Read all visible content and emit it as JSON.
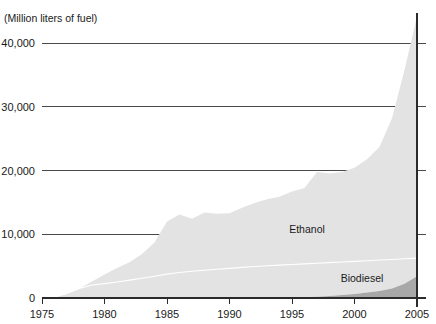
{
  "chart_data": {
    "type": "area",
    "stacked": true,
    "title": "",
    "subtitle": "",
    "ylabel": "(Million liters of fuel)",
    "xlabel": "",
    "grid": "horizontal",
    "legend_position": "inline-annotations",
    "xlim": [
      1975,
      2005
    ],
    "ylim": [
      0,
      44500
    ],
    "yticks": [
      0,
      10000,
      20000,
      30000,
      40000
    ],
    "ytick_labels": [
      "0",
      "10,000",
      "20,000",
      "30,000",
      "40,000"
    ],
    "xticks": [
      1975,
      1980,
      1985,
      1990,
      1995,
      2000,
      2005
    ],
    "xtick_labels": [
      "1975",
      "1980",
      "1985",
      "1990",
      "1995",
      "2000",
      "2005"
    ],
    "x": [
      1975,
      1976,
      1977,
      1978,
      1979,
      1980,
      1981,
      1982,
      1983,
      1984,
      1985,
      1986,
      1987,
      1988,
      1989,
      1990,
      1991,
      1992,
      1993,
      1994,
      1995,
      1996,
      1997,
      1998,
      1999,
      2000,
      2001,
      2002,
      2003,
      2004,
      2005
    ],
    "series": [
      {
        "name": "Biodiesel",
        "color": "#a8a8a8",
        "label_x": 2000.6,
        "label_y": 2450,
        "values": [
          0,
          0,
          0,
          0,
          0,
          0,
          0,
          0,
          0,
          0,
          0,
          0,
          0,
          0,
          0,
          0,
          0,
          0,
          0,
          0,
          0,
          120,
          200,
          330,
          470,
          640,
          850,
          1100,
          1500,
          2250,
          3400
        ]
      },
      {
        "name": "Ethanol",
        "color": "#e3e3e3",
        "label_x": 1996.2,
        "label_y": 10200,
        "values": [
          0,
          150,
          700,
          1500,
          2600,
          3700,
          4700,
          5600,
          6900,
          8700,
          12000,
          13100,
          12450,
          13400,
          13200,
          13300,
          14150,
          14900,
          15500,
          15900,
          16700,
          17150,
          19550,
          19200,
          19300,
          19800,
          20900,
          22600,
          26700,
          33500,
          40800
        ]
      }
    ],
    "divider_note": "white boundary line inside light-gray area",
    "divider": [
      1700,
      1750,
      1800,
      1900,
      2050,
      2250,
      2500,
      2800,
      3100,
      3400,
      3750,
      4000,
      4200,
      4350,
      4500,
      4650,
      4800,
      4950,
      5050,
      5150,
      5250,
      5350,
      5450,
      5550,
      5650,
      5750,
      5850,
      5950,
      6050,
      6150,
      6250
    ]
  },
  "colors": {
    "ethanol": "#e3e3e3",
    "biodiesel": "#a8a8a8",
    "gridline": "#4a4a4a",
    "axis": "#2b2b2b",
    "text": "#1a1a1a",
    "divider": "#ffffff",
    "background": "#ffffff"
  }
}
